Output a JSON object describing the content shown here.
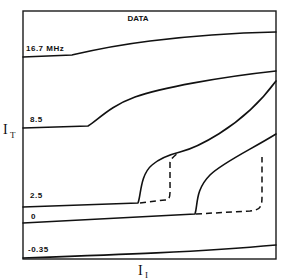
{
  "chart_data": {
    "type": "line",
    "title": "DATA",
    "xlabel": "I_I",
    "ylabel": "I_T",
    "xlabel_main": "I",
    "xlabel_sub": "I",
    "ylabel_main": "I",
    "ylabel_sub": "T",
    "grid": false,
    "legend": "none; curves labeled inline at left edge",
    "series": [
      {
        "name": "16.7 MHz",
        "label": "16.7 MHz",
        "style": "solid",
        "path": "M 23 57 L 72 55 C 85 52 110 46 150 41 S 230 33 276 32"
      },
      {
        "name": "8.5",
        "label": "8.5",
        "style": "solid",
        "path": "M 23 128 L 88 126 C 98 120 110 106 135 97 S 220 77 276 71"
      },
      {
        "name": "2.5",
        "label": "2.5",
        "style": "solid",
        "path": "M 23 207 L 138 203 C 141 196 140 175 152 165 C 160 158 168 155 180 152 S 240 130 276 81"
      },
      {
        "name": "2.5 (hysteresis branch)",
        "label": "",
        "style": "dashed",
        "path": "M 140 203 L 165 200 C 171 200 170 195 170 180 L 170 162 C 171 158 176 155 179 152"
      },
      {
        "name": "0",
        "label": "0",
        "style": "solid",
        "path": "M 23 223 L 195 214 C 198 205 195 190 210 175 C 222 163 250 150 276 134"
      },
      {
        "name": "0 (hysteresis branch)",
        "label": "",
        "style": "dashed",
        "path": "M 196 214 L 250 211 C 262 210 262 205 262 195 L 262 157"
      },
      {
        "name": "-0.35",
        "label": "-0.35",
        "style": "solid",
        "path": "M 23 258 C 110 255 200 252 276 245"
      }
    ],
    "label_positions": [
      {
        "text": "16.7 MHz",
        "x": 26,
        "y": 51
      },
      {
        "text": "8.5",
        "x": 30,
        "y": 122
      },
      {
        "text": "2.5",
        "x": 30,
        "y": 198
      },
      {
        "text": "0",
        "x": 31,
        "y": 219
      },
      {
        "text": "-0.35",
        "x": 28,
        "y": 252
      }
    ],
    "frame": {
      "x": 23,
      "y": 11,
      "width": 253,
      "height": 248
    },
    "annotations": [
      "Dashed segments indicate hysteresis (switching) branches for 2.5 and 0 curves"
    ]
  }
}
